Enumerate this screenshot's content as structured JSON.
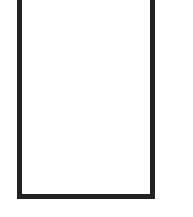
{
  "canvas": {
    "background": "#ffffff"
  },
  "frame": {
    "shape": "rectangle-outline-open-top",
    "stroke_color": "#222222",
    "fill_color": "#ffffff"
  }
}
